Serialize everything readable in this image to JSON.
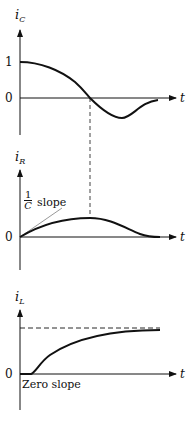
{
  "panels": [
    {
      "id": "ic",
      "var": "i",
      "sub": "C",
      "ticks": [
        {
          "label": "1"
        },
        {
          "label": "0"
        }
      ],
      "xlabel": "t"
    },
    {
      "id": "ir",
      "var": "i",
      "sub": "R",
      "ticks": [
        {
          "label": "0"
        }
      ],
      "xlabel": "t",
      "annotation": {
        "frac_num": "1",
        "frac_den": "C",
        "text": "slope"
      }
    },
    {
      "id": "il",
      "var": "i",
      "sub": "L",
      "ticks": [
        {
          "label": "0"
        }
      ],
      "xlabel": "t",
      "annotation": {
        "text": "Zero slope"
      }
    }
  ],
  "colors": {
    "line": "#111111",
    "tangent": "#999999"
  }
}
